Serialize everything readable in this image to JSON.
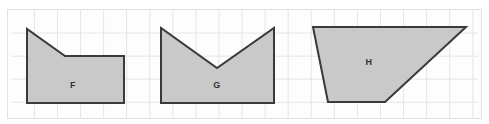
{
  "figure": {
    "title_remnant": "",
    "background_color": "#ffffff",
    "panel": {
      "name": "grid-paper-panel",
      "x": 7,
      "y": 9,
      "width": 475,
      "height": 110,
      "fill": "#fdfdfd",
      "border_color": "#e2e2e6",
      "grid": {
        "cell_size": 23.5,
        "line_color": "#e4e4ea",
        "visible": true
      }
    },
    "shape_style": {
      "fill": "#c9c9c9",
      "stroke": "#3a3a3a",
      "stroke_width": 2
    },
    "shapes": [
      {
        "id": "shape-f",
        "label": "F",
        "label_x": 73,
        "label_y": 85,
        "points": "27,29 27,103 124,103 124,56 65,56",
        "description": "pentagon with diagonal upper-left edge"
      },
      {
        "id": "shape-g",
        "label": "G",
        "label_x": 217,
        "label_y": 85,
        "points": "161,28 161,103 274,103 274,28 217,68",
        "description": "chevron / arrow-notch pentagon"
      },
      {
        "id": "shape-h",
        "label": "H",
        "label_x": 369,
        "label_y": 62,
        "points": "313,27 466,27 385,102 328,102",
        "description": "irregular quadrilateral trapezoid"
      }
    ]
  }
}
